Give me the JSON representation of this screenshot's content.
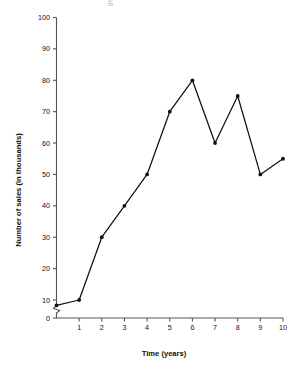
{
  "chart_data": {
    "type": "line",
    "title": "",
    "xlabel": "Time (years)",
    "ylabel": "Number of sales (in thousands)",
    "x": [
      0,
      1,
      2,
      3,
      4,
      5,
      6,
      7,
      8,
      9,
      10
    ],
    "values": [
      7,
      10,
      30,
      40,
      50,
      70,
      80,
      60,
      75,
      50,
      55
    ],
    "xtick_labels": [
      "1",
      "2",
      "3",
      "4",
      "5",
      "6",
      "7",
      "8",
      "9",
      "10"
    ],
    "xticks": [
      1,
      2,
      3,
      4,
      5,
      6,
      7,
      8,
      9,
      10
    ],
    "ytick_labels": [
      "0",
      "10",
      "20",
      "30",
      "40",
      "50",
      "60",
      "70",
      "80",
      "90",
      "100"
    ],
    "yticks": [
      0,
      10,
      20,
      30,
      40,
      50,
      60,
      70,
      80,
      90,
      100
    ],
    "xlim": [
      0,
      10
    ],
    "ylim": [
      0,
      100
    ],
    "grid": false,
    "legend": null,
    "marker": "filled-circle",
    "line_color": "#111111",
    "marker_color": "#111111",
    "axis_color": "#555555",
    "background": "#ffffff",
    "y_axis_break": true,
    "y_axis_break_between": [
      0,
      10
    ],
    "origin_label": "0"
  },
  "artifact": {
    "top_scrap": "g"
  }
}
